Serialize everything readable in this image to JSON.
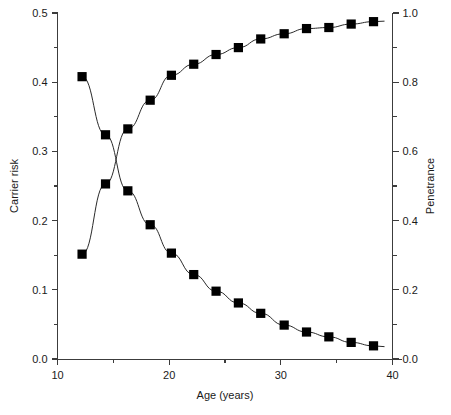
{
  "chart_data": {
    "type": "line",
    "title": "",
    "subtitle": "",
    "xlabel": "Age (years)",
    "ylabel": "Carrier risk",
    "y2label": "Penetrance",
    "xlim": [
      10,
      40
    ],
    "ylim": [
      0.0,
      0.5
    ],
    "y2lim": [
      0.0,
      1.0
    ],
    "grid": false,
    "legend": "none",
    "x_ticks": [
      10,
      20,
      30,
      40
    ],
    "x_tick_labels": [
      "10",
      "20",
      "30",
      "40"
    ],
    "x_minor_ticks": [
      15,
      25,
      35
    ],
    "y_ticks": [
      0.0,
      0.1,
      0.2,
      0.3,
      0.4,
      0.5
    ],
    "y_tick_labels": [
      "0.0",
      "0.1",
      "0.2",
      "0.3",
      "0.4",
      "0.5"
    ],
    "y_minor_ticks": [
      0.05,
      0.15,
      0.25,
      0.35,
      0.45
    ],
    "y2_ticks": [
      0.0,
      0.2,
      0.4,
      0.6,
      0.8,
      1.0
    ],
    "y2_tick_labels": [
      "0.0",
      "0.2",
      "0.4",
      "0.6",
      "0.8",
      "1.0"
    ],
    "y2_minor_ticks": [
      0.1,
      0.3,
      0.5,
      0.7,
      0.9
    ],
    "marker": "filled-square",
    "marker_color": "#000000",
    "line_color": "#2a2a2a",
    "series": [
      {
        "name": "Carrier risk",
        "axis": "left",
        "x": [
          12.2,
          14.3,
          16.3,
          18.3,
          20.2,
          22.2,
          24.2,
          26.2,
          28.2,
          30.3,
          32.3,
          34.3,
          36.3,
          38.3
        ],
        "values": [
          0.408,
          0.324,
          0.243,
          0.194,
          0.153,
          0.122,
          0.098,
          0.081,
          0.066,
          0.049,
          0.039,
          0.032,
          0.024,
          0.019
        ]
      },
      {
        "name": "Penetrance",
        "axis": "right",
        "x": [
          12.2,
          14.3,
          16.3,
          18.3,
          20.2,
          22.2,
          24.2,
          26.2,
          28.2,
          30.3,
          32.3,
          34.3,
          36.3,
          38.3
        ],
        "values": [
          0.303,
          0.506,
          0.665,
          0.748,
          0.82,
          0.852,
          0.88,
          0.9,
          0.925,
          0.94,
          0.955,
          0.958,
          0.968,
          0.975
        ]
      }
    ]
  },
  "axes": {
    "x_title": "Age (years)",
    "y_left_title": "Carrier risk",
    "y_right_title": "Penetrance"
  }
}
